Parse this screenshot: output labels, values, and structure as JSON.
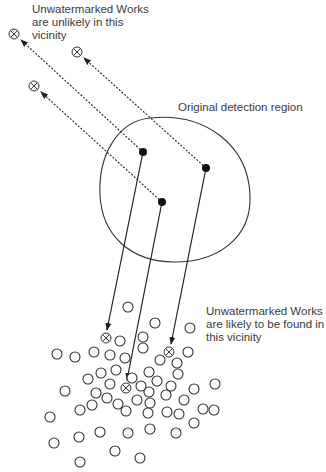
{
  "labels": {
    "top": "Unwatermarked Works\nare unlikely in this\nvicinity",
    "region": "Original detection region",
    "bottom": "Unwatermarked Works\nare likely to be found in\nthis vicinity"
  },
  "colors": {
    "stroke": "#333333",
    "text": "#3a3a3a",
    "background": "#ffffff"
  },
  "icons": {
    "unwatermarked_work": "crossed-circle-icon",
    "watermarked_work": "filled-dot-icon",
    "random_work": "open-circle-icon"
  },
  "diagram": {
    "detection_region": {
      "cx": 170,
      "cy": 190,
      "shape": "closed blob"
    },
    "watermarked_points": [
      {
        "x": 143,
        "y": 152
      },
      {
        "x": 206,
        "y": 168
      },
      {
        "x": 162,
        "y": 202
      }
    ],
    "far_unwatermarked": [
      {
        "x": 14,
        "y": 34
      },
      {
        "x": 77,
        "y": 52
      },
      {
        "x": 34,
        "y": 86
      }
    ],
    "near_unwatermarked": [
      {
        "x": 106,
        "y": 338
      },
      {
        "x": 169,
        "y": 352
      },
      {
        "x": 126,
        "y": 388
      }
    ]
  }
}
